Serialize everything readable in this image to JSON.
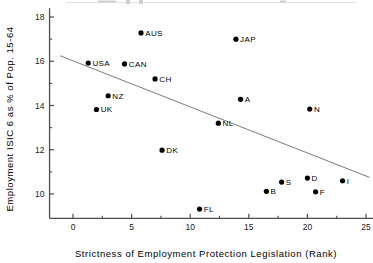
{
  "chart_data": {
    "type": "scatter",
    "title": "",
    "xlabel": "Strictness of Employment Protection Legislation (Rank)",
    "ylabel": "Employment ISIC 6 as % of Pop. 15-64",
    "xlim": [
      -2,
      25.6
    ],
    "ylim": [
      8.9,
      18.4
    ],
    "xticks": [
      0,
      5,
      10,
      15,
      20,
      25
    ],
    "xtick_labels": [
      "0",
      "5",
      "10",
      "15",
      "20",
      "25"
    ],
    "xminor_ticks": [
      2.5,
      7.5,
      12.5,
      17.5,
      22.5
    ],
    "yticks": [
      10,
      12,
      14,
      16,
      18
    ],
    "ytick_labels": [
      "10",
      "12",
      "14",
      "16",
      "18"
    ],
    "yminor_ticks": [
      11,
      13,
      15,
      17
    ],
    "grid": false,
    "legend": false,
    "marker_color": "#000000",
    "trend_color": "#6b6b6b",
    "axis_color": "#4d4d4d",
    "points": [
      {
        "label": "AUS",
        "x": 5.8,
        "y": 17.28,
        "label_side": "right"
      },
      {
        "label": "JAP",
        "x": 13.9,
        "y": 17.0,
        "label_side": "right"
      },
      {
        "label": "USA",
        "x": 1.3,
        "y": 15.92,
        "label_side": "right"
      },
      {
        "label": "CAN",
        "x": 4.4,
        "y": 15.88,
        "label_side": "right"
      },
      {
        "label": "CH",
        "x": 7.0,
        "y": 15.2,
        "label_side": "right"
      },
      {
        "label": "NZ",
        "x": 3.0,
        "y": 14.44,
        "label_side": "right"
      },
      {
        "label": "UK",
        "x": 2.0,
        "y": 13.82,
        "label_side": "right"
      },
      {
        "label": "A",
        "x": 14.3,
        "y": 14.28,
        "label_side": "right"
      },
      {
        "label": "N",
        "x": 20.2,
        "y": 13.84,
        "label_side": "right"
      },
      {
        "label": "NL",
        "x": 12.4,
        "y": 13.2,
        "label_side": "right"
      },
      {
        "label": "DK",
        "x": 7.6,
        "y": 11.98,
        "label_side": "right"
      },
      {
        "label": "S",
        "x": 17.8,
        "y": 10.54,
        "label_side": "right"
      },
      {
        "label": "D",
        "x": 20.0,
        "y": 10.72,
        "label_side": "right"
      },
      {
        "label": "I",
        "x": 23.0,
        "y": 10.6,
        "label_side": "right"
      },
      {
        "label": "B",
        "x": 16.5,
        "y": 10.12,
        "label_side": "right"
      },
      {
        "label": "F",
        "x": 20.7,
        "y": 10.1,
        "label_side": "right"
      },
      {
        "label": "FL",
        "x": 10.8,
        "y": 9.32,
        "label_side": "right"
      }
    ],
    "trend": {
      "x0": -1.1,
      "y0": 16.25,
      "x1": 25.3,
      "y1": 10.75
    }
  }
}
